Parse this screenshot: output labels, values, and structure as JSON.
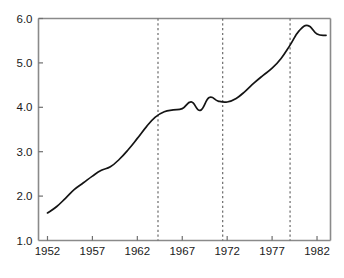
{
  "chart_data": {
    "type": "line",
    "title": "",
    "subtitle": "",
    "xlabel": "",
    "ylabel": "",
    "xlim": [
      1951.0,
      1983.5
    ],
    "ylim": [
      1.0,
      6.0
    ],
    "grid": false,
    "legend": null,
    "legend_position": "none",
    "x_ticks": [
      1952,
      1957,
      1962,
      1967,
      1972,
      1977,
      1982
    ],
    "x_tick_labels": [
      "1952",
      "1957",
      "1962",
      "1967",
      "1972",
      "1977",
      "1982"
    ],
    "y_ticks": [
      1.0,
      2.0,
      3.0,
      4.0,
      5.0,
      6.0
    ],
    "y_tick_labels": [
      "1.0",
      "2.0",
      "3.0",
      "4.0",
      "5.0",
      "6.0"
    ],
    "series": [
      {
        "name": "series-1",
        "color": "#141414",
        "x": [
          1952,
          1953,
          1954,
          1955,
          1956,
          1957,
          1958,
          1959,
          1960,
          1961,
          1962,
          1963,
          1964,
          1965,
          1966,
          1967,
          1968,
          1969,
          1970,
          1971,
          1972,
          1973,
          1974,
          1975,
          1976,
          1977,
          1978,
          1979,
          1980,
          1981,
          1982,
          1983
        ],
        "values": [
          1.62,
          1.76,
          1.95,
          2.15,
          2.3,
          2.45,
          2.58,
          2.66,
          2.83,
          3.05,
          3.3,
          3.56,
          3.78,
          3.9,
          3.94,
          3.97,
          4.12,
          3.93,
          4.22,
          4.14,
          4.12,
          4.2,
          4.36,
          4.55,
          4.72,
          4.88,
          5.1,
          5.4,
          5.72,
          5.84,
          5.65,
          5.62
        ],
        "annotations": []
      }
    ],
    "event_lines": [
      {
        "name": "event-line-1",
        "x": 1964.3,
        "style": "dashed",
        "color": "#6b6b6b"
      },
      {
        "name": "event-line-2",
        "x": 1971.5,
        "style": "dashed",
        "color": "#6b6b6b"
      },
      {
        "name": "event-line-3",
        "x": 1979.0,
        "style": "dashed",
        "color": "#6b6b6b"
      }
    ]
  }
}
